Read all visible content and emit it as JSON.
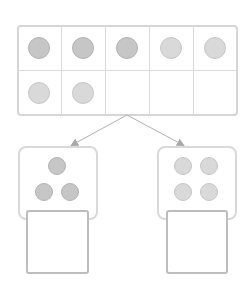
{
  "diagram": {
    "type": "ten-frame-decomposition",
    "ten_frame": {
      "rows": 2,
      "columns": 5,
      "total_dots": 7,
      "cells": [
        [
          "dark",
          "dark",
          "dark",
          "light",
          "light"
        ],
        [
          "light",
          "light",
          "empty",
          "empty",
          "empty"
        ]
      ]
    },
    "parts": [
      {
        "name": "left-part",
        "dot_count": 3,
        "dot_shade": "dark",
        "answer": ""
      },
      {
        "name": "right-part",
        "dot_count": 4,
        "dot_shade": "light",
        "answer": ""
      }
    ],
    "colors": {
      "grid_line": "#dcdcdc",
      "frame_border": "#d6d6d6",
      "dark_dot": "#c6c6c6",
      "light_dot": "#d9d9d9",
      "arrow": "#aaaaaa",
      "answer_border": "#bdbdbd"
    }
  }
}
